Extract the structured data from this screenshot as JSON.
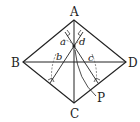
{
  "diagram": {
    "type": "geometry",
    "shape": "rhombus",
    "vertices": {
      "A": "A",
      "B": "B",
      "C": "C",
      "D": "D"
    },
    "point": "P",
    "distances": {
      "a": "a",
      "b": "b",
      "c": "c",
      "d": "d"
    },
    "colors": {
      "line": "#222222",
      "dashed": "#555555",
      "background": "#ffffff"
    }
  }
}
